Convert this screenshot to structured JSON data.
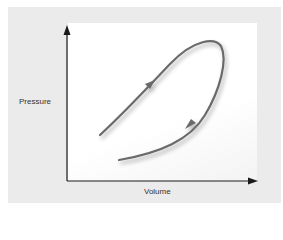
{
  "diagram": {
    "axes": {
      "x_label": "Volume",
      "y_label": "Pressure"
    },
    "curve": {
      "description": "Closed-ish loop: rising upper branch moving right/up, turning at top right, returning down-left on lower branch",
      "direction_arrows": [
        "up-right on upper branch",
        "down-left on lower branch"
      ]
    },
    "colors": {
      "panel": "#ebebeb",
      "plot": "#ffffff",
      "curve": "#6b6b6b",
      "axes": "#1a1a1a"
    }
  }
}
